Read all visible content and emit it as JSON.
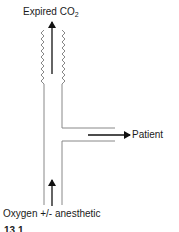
{
  "diagram": {
    "type": "breathing-circuit-T-piece",
    "labels": {
      "top": "Expired CO",
      "top_subscript": "2",
      "right": "Patient",
      "bottom": "Oxygen +/- anesthetic"
    },
    "caption": "13.1 ...",
    "colors": {
      "line": "#888888",
      "arrow": "#111111",
      "text": "#1a1a1a"
    },
    "flows": [
      {
        "from": "bottom",
        "to": "top",
        "label": "Oxygen +/- anesthetic → Expired CO2"
      },
      {
        "from": "junction",
        "to": "right",
        "label": "Patient"
      }
    ],
    "elements": {
      "corrugated_section": "zigzag tube walls at top (reservoir/expiratory limb)",
      "side_branch": "horizontal limb to patient"
    }
  }
}
